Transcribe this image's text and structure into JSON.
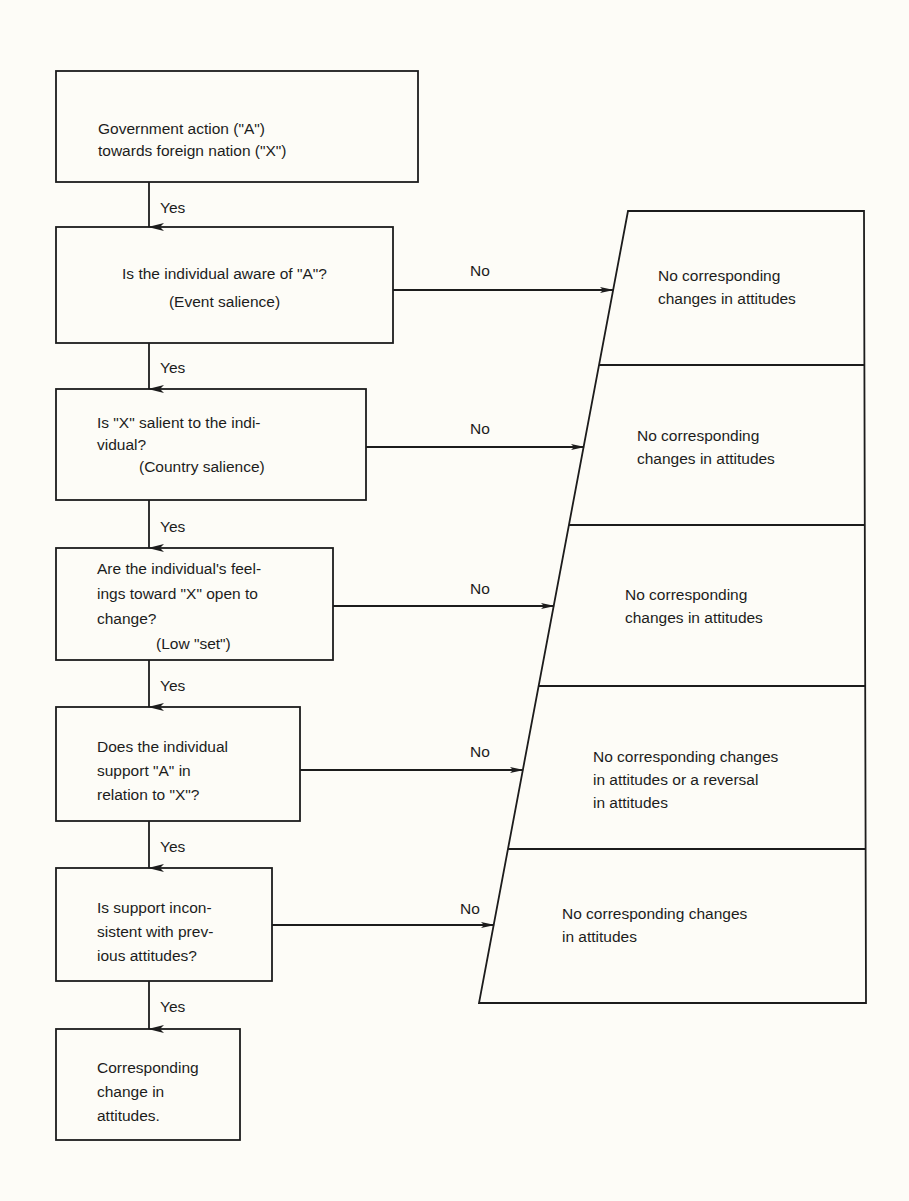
{
  "diagram": {
    "type": "flowchart",
    "colors": {
      "background": "#fdfcf7",
      "ink": "#1c1c1c"
    },
    "start": {
      "lines": [
        "Government action (\"A\")",
        "towards foreign nation (\"X\")"
      ]
    },
    "decisions": [
      {
        "question_lines": [
          "Is the individual aware of \"A\"?"
        ],
        "note": "(Event salience)",
        "yes_label": "Yes",
        "no_label": "No",
        "no_outcome_lines": [
          "No corresponding",
          "changes in attitudes"
        ]
      },
      {
        "question_lines": [
          "Is \"X\" salient to the indi-",
          "vidual?"
        ],
        "note": "(Country salience)",
        "yes_label": "Yes",
        "no_label": "No",
        "no_outcome_lines": [
          "No corresponding",
          "changes in attitudes"
        ]
      },
      {
        "question_lines": [
          "Are the individual's feel-",
          "ings toward \"X\" open to",
          "change?"
        ],
        "note": "(Low \"set\")",
        "yes_label": "Yes",
        "no_label": "No",
        "no_outcome_lines": [
          "No corresponding",
          "changes in attitudes"
        ]
      },
      {
        "question_lines": [
          "Does the individual",
          "support \"A\" in",
          "relation to \"X\"?"
        ],
        "note": "",
        "yes_label": "Yes",
        "no_label": "No",
        "no_outcome_lines": [
          "No corresponding changes",
          "in attitudes or a reversal",
          "in attitudes"
        ]
      },
      {
        "question_lines": [
          "Is support incon-",
          "sistent with prev-",
          "ious attitudes?"
        ],
        "note": "",
        "yes_label": "Yes",
        "no_label": "No",
        "no_outcome_lines": [
          "No corresponding changes",
          "in attitudes"
        ]
      }
    ],
    "start_yes_label": "Yes",
    "end": {
      "lines": [
        "Corresponding",
        "change in",
        "attitudes."
      ]
    }
  }
}
